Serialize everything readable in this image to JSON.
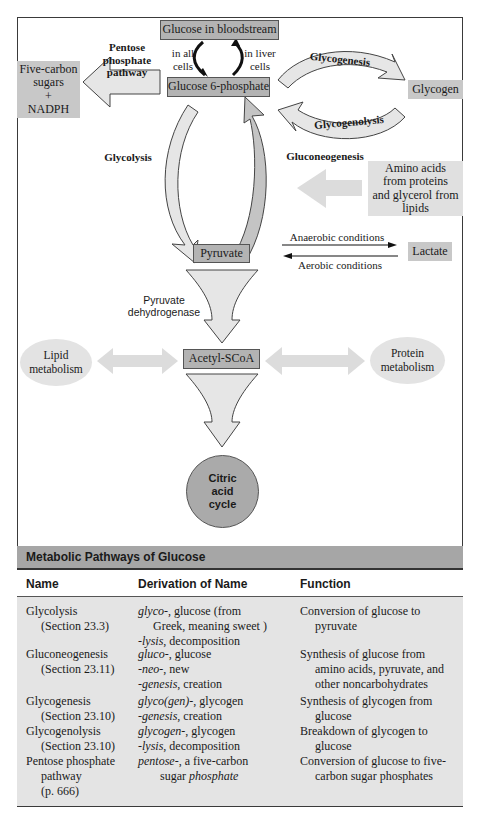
{
  "diagram": {
    "nodes": {
      "glucose_bloodstream": "Glucose in bloodstream",
      "glucose_6_phosphate": "Glucose 6-phosphate",
      "five_carbon": [
        "Five-carbon",
        "sugars",
        "+",
        "NADPH"
      ],
      "glycogen": "Glycogen",
      "amino_acids": [
        "Amino acids",
        "from proteins",
        "and glycerol from",
        "lipids"
      ],
      "pyruvate": "Pyruvate",
      "lactate": "Lactate",
      "acetyl_scoa": "Acetyl-SCoA",
      "lipid_metabolism": [
        "Lipid",
        "metabolism"
      ],
      "protein_metabolism": [
        "Protein",
        "metabolism"
      ],
      "citric_acid_cycle": [
        "Citric",
        "acid",
        "cycle"
      ]
    },
    "labels": {
      "pentose_pathway": [
        "Pentose",
        "phosphate",
        "pathway"
      ],
      "in_all_cells": [
        "in all",
        "cells"
      ],
      "in_liver_cells": [
        "in liver",
        "cells"
      ],
      "glycogenesis": "Glycogenesis",
      "glycogenolysis": "Glycogenolysis",
      "glycolysis": "Glycolysis",
      "gluconeogenesis": "Gluconeogenesis",
      "anaerobic": "Anaerobic conditions",
      "aerobic": "Aerobic conditions",
      "pyruvate_dehydrogenase": [
        "Pyruvate",
        "dehydrogenase"
      ]
    },
    "colors": {
      "box_fill": "#b3b3b3",
      "arrow_fill": "#e6e6e6",
      "arrow_dark": "#c4c4c4",
      "ellipse_fill": "#e3e3e3",
      "circle_fill": "#aaaaaa"
    }
  },
  "table": {
    "title": "Metabolic Pathways of Glucose",
    "columns": [
      "Name",
      "Derivation of Name",
      "Function"
    ],
    "rows": [
      {
        "name": "Glycolysis",
        "section": "(Section 23.3)",
        "derivation": [
          {
            "prefix": "glyco-",
            "text": ", glucose (from"
          },
          {
            "prefix": "",
            "text": "Greek, meaning  sweet )",
            "indent": true
          },
          {
            "prefix": "-lysis",
            "text": ", decomposition"
          }
        ],
        "function": [
          "Conversion of glucose to",
          "pyruvate"
        ]
      },
      {
        "name": "Gluconeogenesis",
        "section": "(Section 23.11)",
        "derivation": [
          {
            "prefix": "gluco-",
            "text": ", glucose"
          },
          {
            "prefix": "-neo-",
            "text": ", new"
          },
          {
            "prefix": "-genesis",
            "text": ", creation"
          }
        ],
        "function": [
          "Synthesis of glucose from",
          "amino acids, pyruvate, and",
          "other noncarbohydrates"
        ]
      },
      {
        "name": "Glycogenesis",
        "section": "(Section 23.10)",
        "derivation": [
          {
            "prefix": "glyco(gen)-",
            "text": ", glycogen"
          },
          {
            "prefix": "-genesis",
            "text": ", creation"
          }
        ],
        "function": [
          "Synthesis of glycogen from",
          "glucose"
        ]
      },
      {
        "name": "Glycogenolysis",
        "section": "(Section 23.10)",
        "derivation": [
          {
            "prefix": "glycogen-",
            "text": ", glycogen"
          },
          {
            "prefix": "-lysis",
            "text": ", decomposition"
          }
        ],
        "function": [
          "Breakdown of glycogen to",
          "glucose"
        ]
      },
      {
        "name": "Pentose phosphate",
        "section": "pathway",
        "section2": "(p. 666)",
        "derivation": [
          {
            "prefix": "pentose-",
            "text": ", a five-carbon"
          },
          {
            "prefix": "",
            "text": "sugar ",
            "suffix_italic": "phosphate",
            "indent": true
          }
        ],
        "function": [
          "Conversion of glucose to five-",
          "carbon sugar phosphates"
        ]
      }
    ]
  }
}
